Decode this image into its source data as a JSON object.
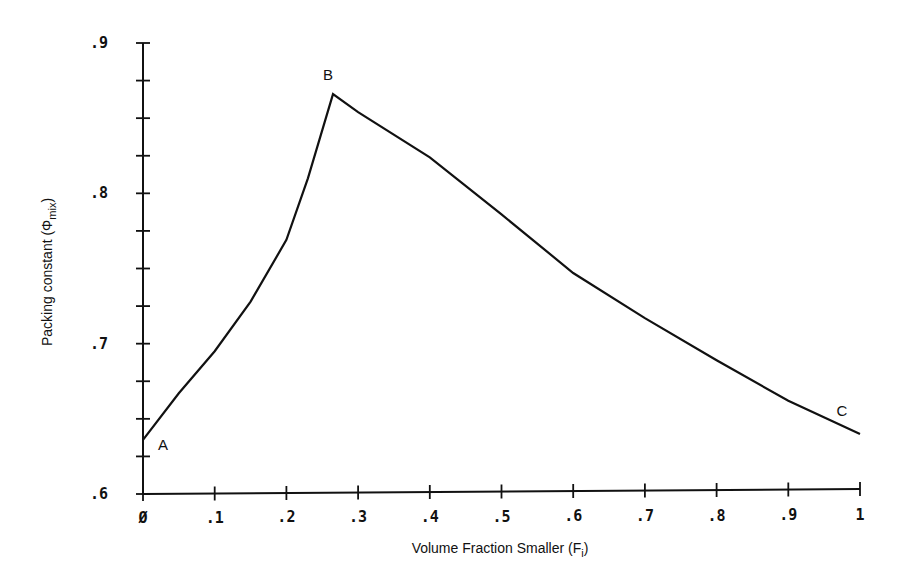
{
  "chart_data": {
    "type": "line",
    "title": "",
    "xlabel": "Volume Fraction Smaller (F",
    "xlabel_sub": "i",
    "xlabel_end": ")",
    "ylabel": "Packing constant (Φ",
    "ylabel_sub": "mix",
    "ylabel_end": ")",
    "xlim": [
      0,
      1
    ],
    "ylim": [
      0.6,
      0.9
    ],
    "grid": false,
    "legend": null,
    "x_tick_labels": [
      "Ø",
      ".1",
      ".2",
      ".3",
      ".4",
      ".5",
      ".6",
      ".7",
      ".8",
      ".9",
      "1"
    ],
    "x_ticks": [
      0,
      0.1,
      0.2,
      0.3,
      0.4,
      0.5,
      0.6,
      0.7,
      0.8,
      0.9,
      1.0
    ],
    "y_tick_labels": [
      ".6",
      ".7",
      ".8",
      ".9"
    ],
    "y_ticks": [
      0.6,
      0.7,
      0.8,
      0.9
    ],
    "y_minor_step": 0.025,
    "series": [
      {
        "name": "Phi_mix",
        "x": [
          0,
          0.05,
          0.1,
          0.15,
          0.2,
          0.23,
          0.265,
          0.3,
          0.4,
          0.5,
          0.6,
          0.7,
          0.8,
          0.9,
          1.0
        ],
        "y": [
          0.636,
          0.667,
          0.695,
          0.728,
          0.769,
          0.81,
          0.866,
          0.854,
          0.824,
          0.786,
          0.747,
          0.717,
          0.689,
          0.662,
          0.64
        ]
      }
    ],
    "annotations": [
      {
        "text": "A",
        "x": 0.0,
        "y": 0.636
      },
      {
        "text": "B",
        "x": 0.265,
        "y": 0.866
      },
      {
        "text": "C",
        "x": 1.0,
        "y": 0.64
      }
    ]
  }
}
